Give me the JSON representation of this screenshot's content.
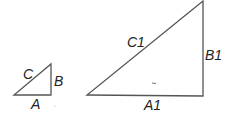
{
  "diagram": {
    "stroke_color": "#555555",
    "small_triangle": {
      "labels": {
        "hypotenuse": "C",
        "vertical_leg": "B",
        "base": "A"
      }
    },
    "large_triangle": {
      "labels": {
        "hypotenuse": "C1",
        "vertical_leg": "B1",
        "base": "A1"
      }
    }
  }
}
